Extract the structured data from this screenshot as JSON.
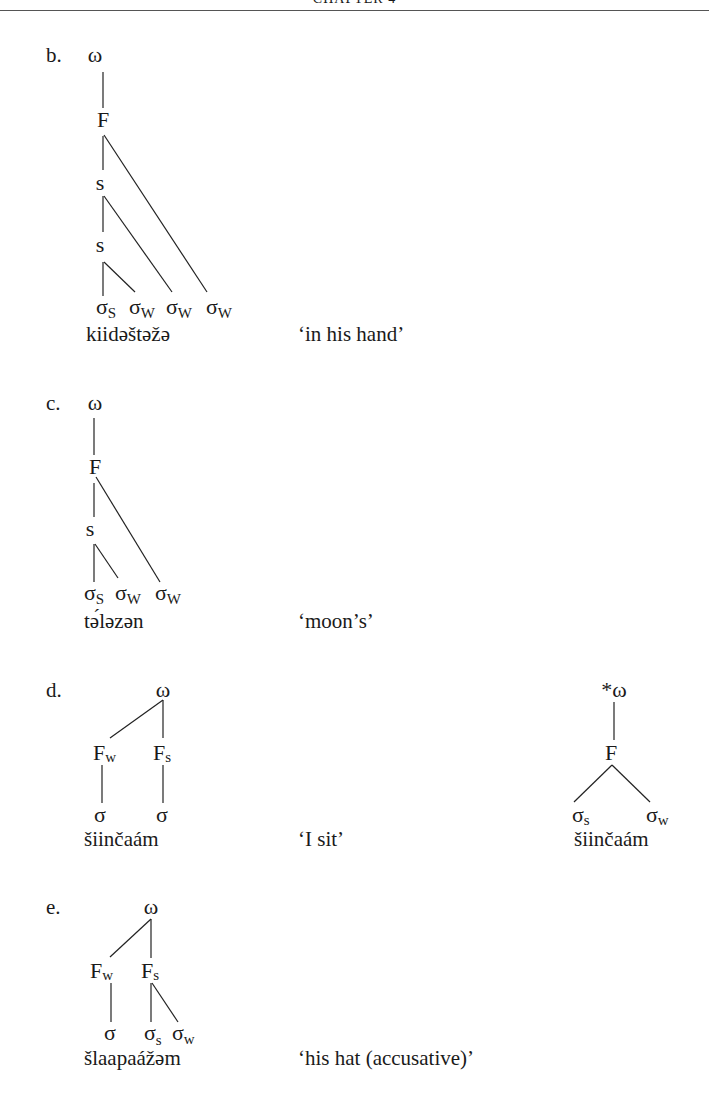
{
  "header": {
    "running_title": "CHAPTER 4"
  },
  "examples": [
    {
      "label": "b.",
      "root": "ω",
      "nodes": [
        "F",
        "s",
        "s"
      ],
      "syllables": [
        {
          "base": "σ",
          "sub": "S"
        },
        {
          "base": "σ",
          "sub": "W"
        },
        {
          "base": "σ",
          "sub": "W"
        },
        {
          "base": "σ",
          "sub": "W"
        }
      ],
      "word": "kiidəštəžə",
      "gloss": "‘in his hand’"
    },
    {
      "label": "c.",
      "root": "ω",
      "nodes": [
        "F",
        "s"
      ],
      "syllables": [
        {
          "base": "σ",
          "sub": "S"
        },
        {
          "base": "σ",
          "sub": "W"
        },
        {
          "base": "σ",
          "sub": "W"
        }
      ],
      "word": "tə́ləzən",
      "gloss": "‘moon’s’"
    },
    {
      "label": "d.",
      "root": "ω",
      "feet": [
        {
          "base": "F",
          "sub": "w"
        },
        {
          "base": "F",
          "sub": "s"
        }
      ],
      "syllables": [
        {
          "base": "σ",
          "sub": ""
        },
        {
          "base": "σ",
          "sub": ""
        }
      ],
      "word": "šiinčaám",
      "gloss": "‘I sit’",
      "ungrammatical": {
        "root": "*ω",
        "foot": "F",
        "syllables": [
          {
            "base": "σ",
            "sub": "s"
          },
          {
            "base": "σ",
            "sub": "w"
          }
        ],
        "word": "šiinčaám"
      }
    },
    {
      "label": "e.",
      "root": "ω",
      "feet": [
        {
          "base": "F",
          "sub": "w"
        },
        {
          "base": "F",
          "sub": "s"
        }
      ],
      "syllables": [
        {
          "base": "σ",
          "sub": ""
        },
        {
          "base": "σ",
          "sub": "s"
        },
        {
          "base": "σ",
          "sub": "w"
        }
      ],
      "word": "šlaapaážəm",
      "gloss": "‘his hat (accusative)’"
    }
  ]
}
